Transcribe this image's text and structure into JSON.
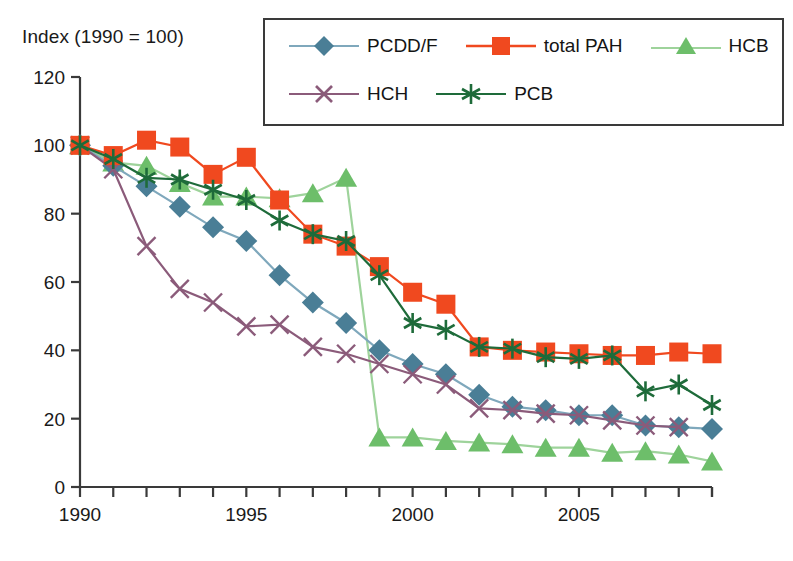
{
  "chart_data": {
    "type": "line",
    "title": "Index (1990 = 100)",
    "subtitle": "",
    "xlabel": "",
    "ylabel": "",
    "xlim": [
      1990,
      2009
    ],
    "ylim": [
      0,
      120
    ],
    "yticks": [
      0,
      20,
      40,
      60,
      80,
      100,
      120
    ],
    "ytick_labels": [
      "0",
      "20",
      "40",
      "60",
      "80",
      "100",
      "120"
    ],
    "xticks": [
      1990,
      1991,
      1992,
      1993,
      1994,
      1995,
      1996,
      1997,
      1998,
      1999,
      2000,
      2001,
      2002,
      2003,
      2004,
      2005,
      2006,
      2007,
      2008,
      2009
    ],
    "xtick_labels_shown": [
      "1990",
      "1995",
      "2000",
      "2005"
    ],
    "xtick_labels_shown_at": [
      1990,
      1995,
      2000,
      2005
    ],
    "grid": false,
    "legend_position": "top-right",
    "x": [
      1990,
      1991,
      1992,
      1993,
      1994,
      1995,
      1996,
      1997,
      1998,
      1999,
      2000,
      2001,
      2002,
      2003,
      2004,
      2005,
      2006,
      2007,
      2008,
      2009
    ],
    "series": [
      {
        "name": "PCDD/F",
        "marker": "diamond",
        "color": "#4A7E96",
        "line_color": "#7FA8BC",
        "values": [
          100,
          94,
          88,
          82,
          76,
          72,
          62,
          54,
          48,
          40,
          36,
          33,
          27,
          23.5,
          22.5,
          21,
          21,
          18,
          17.5,
          17
        ]
      },
      {
        "name": "total PAH",
        "marker": "square",
        "color": "#F0491F",
        "line_color": "#F0491F",
        "values": [
          100,
          97,
          101.5,
          99.5,
          91.5,
          96.5,
          84,
          74,
          70.5,
          64.5,
          57,
          53.5,
          41,
          40,
          39.5,
          39,
          38.5,
          38.5,
          39.5,
          39
        ]
      },
      {
        "name": "HCB",
        "marker": "triangle",
        "color": "#6DBE6A",
        "line_color": "#9ED39B",
        "values": [
          100,
          95,
          94,
          89,
          85,
          85,
          84.5,
          86,
          90.5,
          14.5,
          14.5,
          13.5,
          13,
          12.5,
          11.5,
          11.5,
          10,
          10.5,
          9.5,
          7.5
        ]
      },
      {
        "name": "HCH",
        "marker": "cross",
        "color": "#8B5B7A",
        "line_color": "#8B5B7A",
        "values": [
          100,
          93,
          70.5,
          58,
          54,
          47,
          47.5,
          41,
          39,
          36,
          33,
          30,
          23,
          22.5,
          21.5,
          21,
          19.5,
          18,
          17.5,
          null
        ]
      },
      {
        "name": "PCB",
        "marker": "asterisk",
        "color": "#1E6B3A",
        "line_color": "#1E6B3A",
        "values": [
          100,
          96,
          90.5,
          90,
          87,
          84,
          78,
          74,
          72,
          62,
          48,
          46,
          41,
          40.5,
          38,
          37.5,
          38.5,
          28,
          30,
          24
        ]
      }
    ]
  }
}
